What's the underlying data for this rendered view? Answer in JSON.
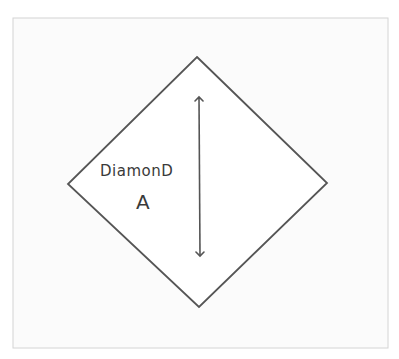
{
  "diagram": {
    "frame": {
      "x": 13,
      "y": 18,
      "width": 375,
      "height": 330,
      "stroke": "#d4d4d4",
      "fill": "#fbfbfb"
    },
    "shape": {
      "type": "diamond",
      "label_line1": "DiamonD",
      "label_line2": "A",
      "vertices": {
        "top": [
          197,
          57
        ],
        "right": [
          327,
          183
        ],
        "bottom": [
          199,
          307
        ],
        "left": [
          68,
          184
        ]
      },
      "stroke": "#555555"
    },
    "dimension_arrow": {
      "orientation": "vertical",
      "double_headed": true,
      "from": [
        199,
        96
      ],
      "to": [
        200,
        257
      ],
      "stroke": "#555555"
    }
  }
}
